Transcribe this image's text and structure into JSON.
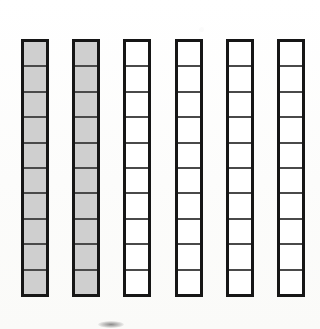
{
  "figure": {
    "background_color": "#fdfdfc",
    "outline_color": "#161616",
    "divider_color": "#4a4a4a",
    "fill_color": "#cfcfcf",
    "empty_color": "#ffffff",
    "bar_count": 6,
    "segments_per_bar": 10,
    "filled_bar_count": 2,
    "empty_bar_count": 4
  },
  "chart_data": {
    "type": "bar",
    "xlabel": "",
    "ylabel": "",
    "categories": [
      "1",
      "2",
      "3",
      "4",
      "5",
      "6"
    ],
    "values": [
      10,
      10,
      0,
      0,
      0,
      0
    ],
    "ylim": [
      0,
      10
    ],
    "grid": false,
    "legend": "none"
  },
  "bars": [
    {
      "label": "bar-1",
      "filled": true,
      "fill": "#cfcfcf",
      "segments": 10,
      "filled_segments": 10,
      "x": 21,
      "y": 39,
      "width": 28,
      "height": 258
    },
    {
      "label": "bar-2",
      "filled": true,
      "fill": "#cfcfcf",
      "segments": 10,
      "filled_segments": 10,
      "x": 72,
      "y": 39,
      "width": 28,
      "height": 258
    },
    {
      "label": "bar-3",
      "filled": false,
      "fill": "#ffffff",
      "segments": 10,
      "filled_segments": 0,
      "x": 123,
      "y": 39,
      "width": 28,
      "height": 258
    },
    {
      "label": "bar-4",
      "filled": false,
      "fill": "#ffffff",
      "segments": 10,
      "filled_segments": 0,
      "x": 175,
      "y": 39,
      "width": 28,
      "height": 258
    },
    {
      "label": "bar-5",
      "filled": false,
      "fill": "#ffffff",
      "segments": 10,
      "filled_segments": 0,
      "x": 226,
      "y": 39,
      "width": 28,
      "height": 258
    },
    {
      "label": "bar-6",
      "filled": false,
      "fill": "#ffffff",
      "segments": 10,
      "filled_segments": 0,
      "x": 277,
      "y": 39,
      "width": 28,
      "height": 258
    }
  ],
  "artifacts": {
    "smudge": {
      "x": 98,
      "y": 321,
      "width": 26,
      "height": 7
    }
  }
}
